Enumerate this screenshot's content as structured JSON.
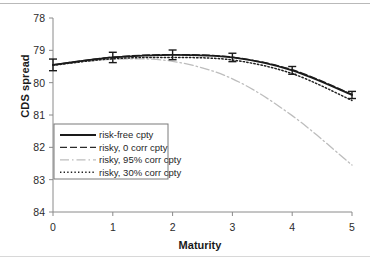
{
  "chart_data": {
    "type": "line",
    "title": "",
    "xlabel": "Maturity",
    "ylabel": "CDS spread",
    "xlim": [
      0,
      5
    ],
    "ylim": [
      78,
      84
    ],
    "xticks": [
      0,
      1,
      2,
      3,
      4,
      5
    ],
    "yticks": [
      78,
      79,
      80,
      81,
      82,
      83,
      84
    ],
    "grid": false,
    "legend_position": "lower-left-inside",
    "x": [
      0,
      1,
      2,
      3,
      4,
      5
    ],
    "series": [
      {
        "name": "risk-free cpty",
        "style": "solid",
        "color": "#1a1a1a",
        "values": [
          82.55,
          82.78,
          82.86,
          82.78,
          82.38,
          81.62
        ],
        "error_bars": [
          0.18,
          0.16,
          0.15,
          0.13,
          0.12,
          0.11
        ]
      },
      {
        "name": "risky, 0 corr cpty",
        "style": "dashed",
        "color": "#2a2a2a",
        "values": [
          82.55,
          82.79,
          82.87,
          82.79,
          82.4,
          81.64
        ]
      },
      {
        "name": "risky, 95% corr cpty",
        "style": "dash-dot",
        "color": "#bdbdbd",
        "values": [
          82.54,
          82.72,
          82.66,
          82.12,
          80.98,
          79.45
        ]
      },
      {
        "name": "risky, 30% corr cpty",
        "style": "dotted",
        "color": "#202020",
        "values": [
          82.54,
          82.74,
          82.78,
          82.7,
          82.28,
          81.45
        ]
      }
    ]
  },
  "axes": {
    "y_tick_labels": [
      "84",
      "83",
      "82",
      "81",
      "80",
      "79",
      "78"
    ],
    "x_tick_labels": [
      "0",
      "1",
      "2",
      "3",
      "4",
      "5"
    ],
    "y_axis_title": "CDS spread",
    "x_axis_title": "Maturity"
  },
  "legend": {
    "items": [
      {
        "label": "risk-free cpty",
        "style": "solid"
      },
      {
        "label": "risky, 0 corr cpty",
        "style": "dashed"
      },
      {
        "label": "risky, 95% corr cpty",
        "style": "dash-dot"
      },
      {
        "label": "risky, 30% corr cpty",
        "style": "dotted"
      }
    ]
  }
}
